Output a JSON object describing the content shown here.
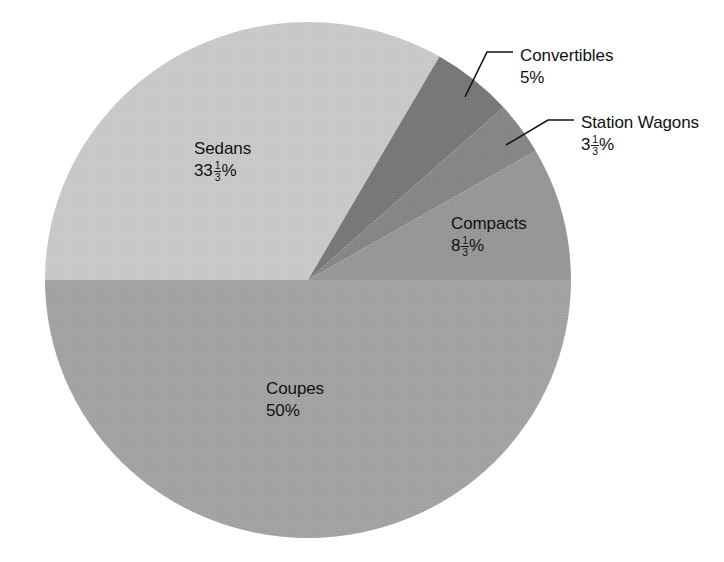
{
  "chart_data": {
    "type": "pie",
    "title": "",
    "subtitle": "",
    "xlabel": "",
    "ylabel": "",
    "legend_position": "none",
    "grid": false,
    "units": "percent",
    "total": 100,
    "center": {
      "x": 308,
      "y": 280
    },
    "radius": {
      "x": 263,
      "y": 258
    },
    "start_angle_deg": 0,
    "direction": "counterclockwise",
    "categories": [
      "Coupes",
      "Sedans",
      "Convertibles",
      "Station Wagons",
      "Compacts"
    ],
    "values": [
      50,
      33.3333,
      5,
      3.3333,
      8.3333
    ],
    "value_labels": [
      "50%",
      "33 1/3%",
      "5%",
      "3 1/3%",
      "8 1/3%"
    ],
    "colors": [
      "#a3a3a3",
      "#c9c9c9",
      "#787878",
      "#868686",
      "#979797"
    ],
    "slices": [
      {
        "name": "Coupes",
        "value": 50,
        "value_label": "50%",
        "label_text": "Coupes",
        "color": "#a3a3a3",
        "whole": "50",
        "numerator": "",
        "denominator": "",
        "percent_sign": "%",
        "has_fraction": false,
        "start_angle_deg": 180,
        "end_angle_deg": 360
      },
      {
        "name": "Sedans",
        "value": 33.3333,
        "value_label": "33 1/3%",
        "label_text": "Sedans",
        "color": "#c9c9c9",
        "whole": "33",
        "numerator": "1",
        "denominator": "3",
        "percent_sign": "%",
        "has_fraction": true,
        "start_angle_deg": 60,
        "end_angle_deg": 180
      },
      {
        "name": "Convertibles",
        "value": 5,
        "value_label": "5%",
        "label_text": "Convertibles",
        "color": "#787878",
        "whole": "5",
        "numerator": "",
        "denominator": "",
        "percent_sign": "%",
        "has_fraction": false,
        "start_angle_deg": 42,
        "end_angle_deg": 60
      },
      {
        "name": "Station Wagons",
        "value": 3.3333,
        "value_label": "3 1/3%",
        "label_text": "Station Wagons",
        "color": "#868686",
        "whole": "3",
        "numerator": "1",
        "denominator": "3",
        "percent_sign": "%",
        "has_fraction": true,
        "start_angle_deg": 30,
        "end_angle_deg": 42
      },
      {
        "name": "Compacts",
        "value": 8.3333,
        "value_label": "8 1/3%",
        "label_text": "Compacts",
        "color": "#979797",
        "whole": "8",
        "numerator": "1",
        "denominator": "3",
        "percent_sign": "%",
        "has_fraction": true,
        "start_angle_deg": 0,
        "end_angle_deg": 30
      }
    ],
    "leader_lines": [
      {
        "for": "Convertibles",
        "from": {
          "x": 465,
          "y": 97
        },
        "to": {
          "x": 513,
          "y": 52
        }
      },
      {
        "for": "Station Wagons",
        "from": {
          "x": 506,
          "y": 145
        },
        "to": {
          "x": 574,
          "y": 120
        }
      }
    ],
    "background_color": "#ffffff",
    "text_color": "#111111"
  }
}
